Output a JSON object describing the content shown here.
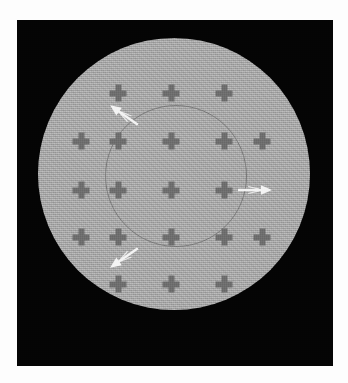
{
  "image": {
    "kind": "phantom-scan-image",
    "background_color": "#ffffff",
    "plate_color": "#040404",
    "disk_color": "#a9a9a9",
    "marker_color": "#6e6e6e",
    "inner_circle_color": "#7b7b7b",
    "arrow_color": "#f4f4f4",
    "frame": {
      "x": 17,
      "y": 20,
      "width": 316,
      "height": 346
    }
  },
  "scene": {
    "disk": {
      "cx": 157,
      "cy": 154,
      "r": 136,
      "label": "outer-phantom-disk"
    },
    "inner_circle": {
      "cx": 159,
      "cy": 156,
      "r": 71,
      "label": "inner-boundary-circle"
    },
    "grid": {
      "columns_x": [
        64,
        101,
        154,
        191,
        229
      ],
      "rows_y": [
        73,
        121,
        170,
        217,
        264
      ],
      "spacing_x": 37,
      "spacing_y": 48,
      "marker_shape": "plus-cross",
      "marker_size": 17
    },
    "markers": [
      {
        "cx": 101,
        "cy": 73
      },
      {
        "cx": 154,
        "cy": 73
      },
      {
        "cx": 207,
        "cy": 73
      },
      {
        "cx": 64,
        "cy": 121
      },
      {
        "cx": 101,
        "cy": 121
      },
      {
        "cx": 154,
        "cy": 121
      },
      {
        "cx": 207,
        "cy": 121
      },
      {
        "cx": 245,
        "cy": 121
      },
      {
        "cx": 64,
        "cy": 170
      },
      {
        "cx": 101,
        "cy": 170
      },
      {
        "cx": 154,
        "cy": 170
      },
      {
        "cx": 207,
        "cy": 170
      },
      {
        "cx": 64,
        "cy": 217
      },
      {
        "cx": 101,
        "cy": 217
      },
      {
        "cx": 154,
        "cy": 217
      },
      {
        "cx": 207,
        "cy": 217
      },
      {
        "cx": 245,
        "cy": 217
      },
      {
        "cx": 101,
        "cy": 264
      },
      {
        "cx": 154,
        "cy": 264
      },
      {
        "cx": 207,
        "cy": 264
      }
    ],
    "arrows": [
      {
        "name": "arrow-upper-left",
        "x": 107,
        "y": 95,
        "rotation": 215,
        "length": 34
      },
      {
        "name": "arrow-right",
        "x": 238,
        "y": 170,
        "rotation": 0,
        "length": 34
      },
      {
        "name": "arrow-lower-left",
        "x": 107,
        "y": 238,
        "rotation": 145,
        "length": 34
      }
    ]
  }
}
